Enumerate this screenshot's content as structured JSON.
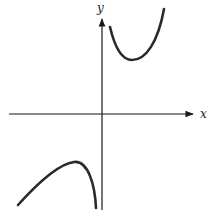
{
  "figure": {
    "type": "function-sketch",
    "axes": {
      "x_label": "x",
      "y_label": "y",
      "color": "#1a1a1a"
    },
    "curves": [
      {
        "name": "upper-branch",
        "description": "U-shaped branch in first quadrant, rising steeply near y-axis, local minimum, then rising",
        "color": "#2a2a2a"
      },
      {
        "name": "lower-branch",
        "description": "Inverted branch in third quadrant, rising to a local maximum then plunging near y-axis",
        "color": "#2a2a2a"
      }
    ]
  }
}
